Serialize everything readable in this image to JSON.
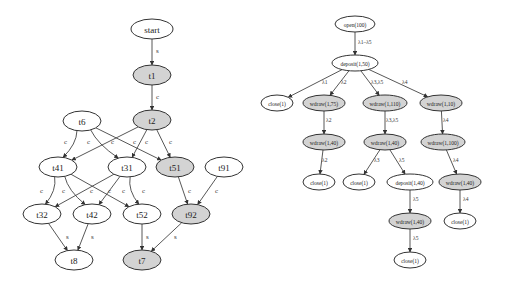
{
  "colors": {
    "shaded": "#d3d3d3",
    "plain": "#ffffff",
    "stroke": "#333333"
  },
  "left_graph": {
    "nodes": [
      {
        "id": "start",
        "label": "start",
        "x": 152,
        "y": 29,
        "rx": 21,
        "ry": 10,
        "shaded": false
      },
      {
        "id": "t1",
        "label": "t1",
        "x": 152,
        "y": 75,
        "rx": 19,
        "ry": 10,
        "shaded": true
      },
      {
        "id": "t2",
        "label": "t2",
        "x": 152,
        "y": 120,
        "rx": 19,
        "ry": 10,
        "shaded": true
      },
      {
        "id": "t6",
        "label": "t6",
        "x": 82,
        "y": 121,
        "rx": 19,
        "ry": 10,
        "shaded": false
      },
      {
        "id": "t41",
        "label": "t41",
        "x": 58,
        "y": 167,
        "rx": 19,
        "ry": 10,
        "shaded": false
      },
      {
        "id": "t31",
        "label": "t31",
        "x": 127,
        "y": 167,
        "rx": 19,
        "ry": 10,
        "shaded": false
      },
      {
        "id": "t51",
        "label": "t51",
        "x": 175,
        "y": 167,
        "rx": 19,
        "ry": 10,
        "shaded": true
      },
      {
        "id": "t91",
        "label": "t91",
        "x": 224,
        "y": 167,
        "rx": 19,
        "ry": 10,
        "shaded": false
      },
      {
        "id": "t32",
        "label": "t32",
        "x": 42,
        "y": 214,
        "rx": 19,
        "ry": 10,
        "shaded": false
      },
      {
        "id": "t42",
        "label": "t42",
        "x": 92,
        "y": 214,
        "rx": 19,
        "ry": 10,
        "shaded": false
      },
      {
        "id": "t52",
        "label": "t52",
        "x": 142,
        "y": 214,
        "rx": 19,
        "ry": 10,
        "shaded": false
      },
      {
        "id": "t92",
        "label": "t92",
        "x": 191,
        "y": 214,
        "rx": 19,
        "ry": 10,
        "shaded": true
      },
      {
        "id": "t8",
        "label": "t8",
        "x": 74,
        "y": 260,
        "rx": 19,
        "ry": 10,
        "shaded": false
      },
      {
        "id": "t7",
        "label": "t7",
        "x": 142,
        "y": 260,
        "rx": 19,
        "ry": 10,
        "shaded": true
      }
    ],
    "edges": [
      {
        "from": "start",
        "to": "t1",
        "label": "s",
        "lx": 156,
        "ly": 53
      },
      {
        "from": "t1",
        "to": "t2",
        "label": "c",
        "lx": 156,
        "ly": 99
      },
      {
        "from": "t6",
        "to": "t41",
        "label": "c",
        "lx": 64,
        "ly": 144,
        "curve": true
      },
      {
        "from": "t6",
        "to": "t31",
        "label": "c",
        "lx": 87,
        "ly": 144,
        "curve": true
      },
      {
        "from": "t6",
        "to": "t51",
        "label": "c",
        "lx": 133,
        "ly": 144
      },
      {
        "from": "t2",
        "to": "t41",
        "label": "c",
        "lx": 111,
        "ly": 144
      },
      {
        "from": "t2",
        "to": "t31",
        "label": "c",
        "lx": 145,
        "ly": 144
      },
      {
        "from": "t2",
        "to": "t51",
        "label": "c",
        "lx": 169,
        "ly": 144
      },
      {
        "from": "t41",
        "to": "t32",
        "label": "c",
        "lx": 40,
        "ly": 193,
        "curve": true
      },
      {
        "from": "t41",
        "to": "t42",
        "label": "c",
        "lx": 62,
        "ly": 193,
        "curve": true
      },
      {
        "from": "t41",
        "to": "t52",
        "label": "c",
        "lx": 108,
        "ly": 193
      },
      {
        "from": "t31",
        "to": "t32",
        "label": "c",
        "lx": 90,
        "ly": 193
      },
      {
        "from": "t31",
        "to": "t42",
        "label": "c",
        "lx": 122,
        "ly": 193
      },
      {
        "from": "t31",
        "to": "t52",
        "label": "c",
        "lx": 142,
        "ly": 193,
        "curve": true
      },
      {
        "from": "t51",
        "to": "t92",
        "label": "c",
        "lx": 188,
        "ly": 193
      },
      {
        "from": "t91",
        "to": "t92",
        "label": "c",
        "lx": 215,
        "ly": 193
      },
      {
        "from": "t32",
        "to": "t8",
        "label": "s",
        "lx": 66,
        "ly": 239
      },
      {
        "from": "t42",
        "to": "t8",
        "label": "s",
        "lx": 91,
        "ly": 239
      },
      {
        "from": "t52",
        "to": "t7",
        "label": "s",
        "lx": 146,
        "ly": 239
      },
      {
        "from": "t92",
        "to": "t7",
        "label": "s",
        "lx": 174,
        "ly": 239
      }
    ]
  },
  "right_graph": {
    "nodes": [
      {
        "id": "r_open",
        "label": "open(100)",
        "x": 355,
        "y": 24,
        "rx": 20,
        "ry": 8,
        "shaded": false
      },
      {
        "id": "r_dep1",
        "label": "deposit(1,50)",
        "x": 355,
        "y": 63,
        "rx": 23,
        "ry": 8,
        "shaded": false
      },
      {
        "id": "r_close_a",
        "label": "close(1)",
        "x": 277,
        "y": 103,
        "rx": 16,
        "ry": 8,
        "shaded": false
      },
      {
        "id": "r_wd75",
        "label": "wdraw(1,75)",
        "x": 324,
        "y": 103,
        "rx": 21,
        "ry": 8,
        "shaded": true
      },
      {
        "id": "r_wd110",
        "label": "wdraw(1,110)",
        "x": 385,
        "y": 103,
        "rx": 22,
        "ry": 8,
        "shaded": true
      },
      {
        "id": "r_wd10",
        "label": "wdraw(1,10)",
        "x": 441,
        "y": 103,
        "rx": 21,
        "ry": 8,
        "shaded": true
      },
      {
        "id": "r_wd40a",
        "label": "wdraw(1,40)",
        "x": 324,
        "y": 142,
        "rx": 21,
        "ry": 8,
        "shaded": true
      },
      {
        "id": "r_wd40b",
        "label": "wdraw(1,40)",
        "x": 385,
        "y": 142,
        "rx": 21,
        "ry": 8,
        "shaded": true
      },
      {
        "id": "r_wd100",
        "label": "wdraw(1,100)",
        "x": 443,
        "y": 142,
        "rx": 22,
        "ry": 8,
        "shaded": true
      },
      {
        "id": "r_close_b",
        "label": "close(1)",
        "x": 319,
        "y": 182,
        "rx": 16,
        "ry": 8,
        "shaded": false
      },
      {
        "id": "r_close_c",
        "label": "close(1)",
        "x": 359,
        "y": 182,
        "rx": 16,
        "ry": 8,
        "shaded": false
      },
      {
        "id": "r_dep40",
        "label": "deposit(1,40)",
        "x": 410,
        "y": 182,
        "rx": 23,
        "ry": 8,
        "shaded": false
      },
      {
        "id": "r_wd40c",
        "label": "wdraw(1,40)",
        "x": 460,
        "y": 182,
        "rx": 21,
        "ry": 8,
        "shaded": true
      },
      {
        "id": "r_wd40d",
        "label": "wdraw(1,40)",
        "x": 410,
        "y": 221,
        "rx": 21,
        "ry": 8,
        "shaded": true
      },
      {
        "id": "r_close_d",
        "label": "close(1)",
        "x": 460,
        "y": 221,
        "rx": 16,
        "ry": 8,
        "shaded": false
      },
      {
        "id": "r_close_e",
        "label": "close(1)",
        "x": 410,
        "y": 260,
        "rx": 16,
        "ry": 8,
        "shaded": false
      }
    ],
    "edges": [
      {
        "from": "r_open",
        "to": "r_dep1",
        "label": "λ1–λ5",
        "lx": 358,
        "ly": 44
      },
      {
        "from": "r_dep1",
        "to": "r_close_a",
        "label": "λ1",
        "lx": 322,
        "ly": 84
      },
      {
        "from": "r_dep1",
        "to": "r_wd75",
        "label": "λ2",
        "lx": 341,
        "ly": 84
      },
      {
        "from": "r_dep1",
        "to": "r_wd110",
        "label": "λ3,λ5",
        "lx": 371,
        "ly": 84
      },
      {
        "from": "r_dep1",
        "to": "r_wd10",
        "label": "λ4",
        "lx": 402,
        "ly": 84
      },
      {
        "from": "r_wd75",
        "to": "r_wd40a",
        "label": "λ2",
        "lx": 326,
        "ly": 122
      },
      {
        "from": "r_wd110",
        "to": "r_wd40b",
        "label": "λ3,λ5",
        "lx": 386,
        "ly": 122
      },
      {
        "from": "r_wd10",
        "to": "r_wd100",
        "label": "λ4",
        "lx": 443,
        "ly": 122
      },
      {
        "from": "r_wd40a",
        "to": "r_close_b",
        "label": "λ2",
        "lx": 322,
        "ly": 162
      },
      {
        "from": "r_wd40b",
        "to": "r_close_c",
        "label": "λ3",
        "lx": 374,
        "ly": 162
      },
      {
        "from": "r_wd40b",
        "to": "r_dep40",
        "label": "λ5",
        "lx": 399,
        "ly": 162
      },
      {
        "from": "r_wd100",
        "to": "r_wd40c",
        "label": "λ4",
        "lx": 453,
        "ly": 162
      },
      {
        "from": "r_dep40",
        "to": "r_wd40d",
        "label": "λ5",
        "lx": 413,
        "ly": 201
      },
      {
        "from": "r_wd40c",
        "to": "r_close_d",
        "label": "λ4",
        "lx": 463,
        "ly": 201
      },
      {
        "from": "r_wd40d",
        "to": "r_close_e",
        "label": "λ5",
        "lx": 413,
        "ly": 240
      }
    ]
  }
}
